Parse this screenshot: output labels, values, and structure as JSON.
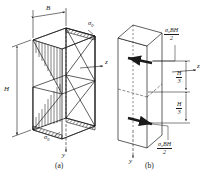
{
  "figure": {
    "type": "engineering-diagram",
    "captions": {
      "left": "(a)",
      "right": "(b)"
    }
  },
  "panel_a": {
    "name": "stress-distribution-3d",
    "dimensions": {
      "width_label": "B",
      "height_label": "H"
    },
    "axes": [
      {
        "name": "z",
        "label": "z",
        "direction": "right"
      },
      {
        "name": "y",
        "label": "y",
        "direction": "down"
      }
    ],
    "stress_labels": [
      {
        "id": "sigma-top",
        "base": "σ",
        "sub": "0"
      },
      {
        "id": "sigma-bottom",
        "base": "σ",
        "sub": "0"
      }
    ],
    "distribution": {
      "shape": "linear-bowtie",
      "top_edge": "compression",
      "bottom_edge": "tension",
      "neutral_axis": "mid-height"
    }
  },
  "panel_b": {
    "name": "equivalent-force-couple",
    "axes": [
      {
        "name": "z",
        "label": "z",
        "direction": "right"
      },
      {
        "name": "y",
        "label": "y",
        "direction": "down"
      }
    ],
    "forces": [
      {
        "id": "resultant-top",
        "numerator": "σ₀BH",
        "denominator": "2",
        "direction": "left"
      },
      {
        "id": "resultant-bottom",
        "numerator": "σ₀BH",
        "denominator": "2",
        "direction": "right"
      }
    ],
    "lever_arms": [
      {
        "id": "arm-upper",
        "numerator": "H",
        "denominator": "3"
      },
      {
        "id": "arm-lower",
        "numerator": "H",
        "denominator": "3"
      }
    ]
  }
}
